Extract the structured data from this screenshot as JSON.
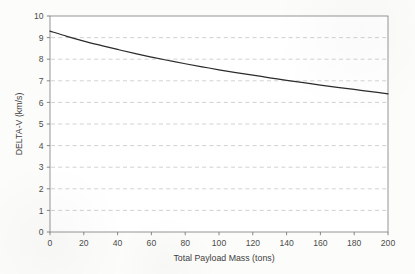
{
  "chart_data": {
    "type": "line",
    "title": "",
    "xlabel": "Total Payload Mass (tons)",
    "ylabel": "DELTA-V (km/s)",
    "xlim": [
      0,
      200
    ],
    "ylim": [
      0,
      10
    ],
    "grid": "horizontal-dashed",
    "legend": "none",
    "xticks": [
      0,
      20,
      40,
      60,
      80,
      100,
      120,
      140,
      160,
      180,
      200
    ],
    "xtick_labels": [
      "0",
      "20",
      "40",
      "60",
      "80",
      "100",
      "120",
      "140",
      "160",
      "180",
      "200"
    ],
    "yticks": [
      0,
      1,
      2,
      3,
      4,
      5,
      6,
      7,
      8,
      9,
      10
    ],
    "ytick_labels": [
      "0",
      "1",
      "2",
      "3",
      "4",
      "5",
      "6",
      "7",
      "8",
      "9",
      "10"
    ],
    "series": [
      {
        "name": "Delta-V vs Total Payload Mass",
        "color": "#2b2b2b",
        "x": [
          0,
          10,
          20,
          30,
          40,
          50,
          60,
          70,
          80,
          90,
          100,
          110,
          120,
          130,
          140,
          150,
          160,
          170,
          180,
          190,
          200
        ],
        "values": [
          9.3,
          9.06,
          8.84,
          8.64,
          8.45,
          8.27,
          8.1,
          7.94,
          7.79,
          7.65,
          7.51,
          7.38,
          7.26,
          7.14,
          7.02,
          6.91,
          6.8,
          6.7,
          6.6,
          6.5,
          6.4
        ]
      }
    ],
    "annotations": []
  },
  "axes": {
    "y_axis_title": "DELTA-V (km/s)",
    "x_axis_title": "Total Payload Mass (tons)"
  }
}
